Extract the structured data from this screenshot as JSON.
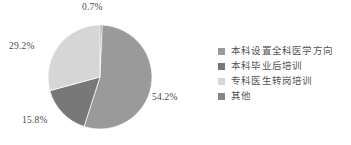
{
  "chart_data": {
    "type": "pie",
    "title": "",
    "subtitle": "",
    "xlabel": "",
    "ylabel": "",
    "grid": false,
    "legend_position": "right",
    "start_angle_deg": 0,
    "direction": "clockwise",
    "categories": [
      "本科设置全科医学方向",
      "本科毕业后培训",
      "专科医生转岗培训",
      "其他"
    ],
    "values": [
      54.2,
      15.8,
      29.2,
      0.7
    ],
    "value_labels": [
      "54.2%",
      "15.8%",
      "29.2%",
      "0.7%"
    ],
    "colors": [
      "#9a9a9a",
      "#787878",
      "#d6d6d6",
      "#868686"
    ],
    "slices": [
      {
        "name": "本科设置全科医学方向",
        "value": 54.2,
        "label": "54.2%",
        "color": "#9a9a9a",
        "label_position": "right"
      },
      {
        "name": "本科毕业后培训",
        "value": 15.8,
        "label": "15.8%",
        "color": "#787878",
        "label_position": "bottom-left"
      },
      {
        "name": "专科医生转岗培训",
        "value": 29.2,
        "label": "29.2%",
        "color": "#d6d6d6",
        "label_position": "left"
      },
      {
        "name": "其他",
        "value": 0.7,
        "label": "0.7%",
        "color": "#868686",
        "label_position": "top"
      }
    ]
  },
  "legend": {
    "items": [
      {
        "label": "本科设置全科医学方向",
        "color": "#9a9a9a"
      },
      {
        "label": "本科毕业后培训",
        "color": "#787878"
      },
      {
        "label": "专科医生转岗培训",
        "color": "#d6d6d6"
      },
      {
        "label": "其他",
        "color": "#868686"
      }
    ]
  },
  "labels": {
    "top": "0.7%",
    "left": "29.2%",
    "bottom": "15.8%",
    "right": "54.2%"
  }
}
